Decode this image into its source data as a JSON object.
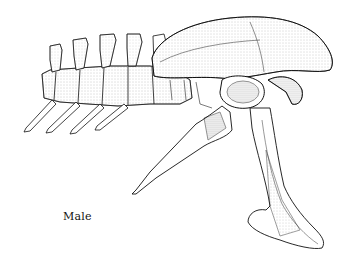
{
  "figure": {
    "caption": "Male",
    "style": "pen-and-ink stipple illustration",
    "colors": {
      "background": "#ffffff",
      "ink": "#111111",
      "shade": "#555555"
    }
  }
}
